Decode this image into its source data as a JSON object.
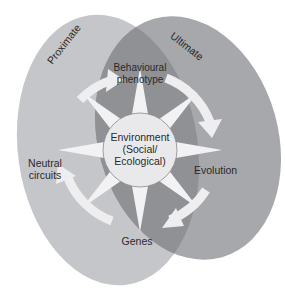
{
  "diagram": {
    "regions": {
      "proximate": {
        "label": "Proximate",
        "color": "#c5c6ca"
      },
      "ultimate": {
        "label": "Ultimate",
        "color": "#a7a8ac"
      },
      "overlap_color": "#909195"
    },
    "center": {
      "line1": "Environment",
      "line2": "(Social/",
      "line3": "Ecological)"
    },
    "cycle": {
      "nodes": [
        {
          "id": "behavioural-phenotype",
          "line1": "Behavioural",
          "line2": "phenotype",
          "position": "top"
        },
        {
          "id": "evolution",
          "line1": "Evolution",
          "position": "right"
        },
        {
          "id": "genes",
          "line1": "Genes",
          "position": "bottom"
        },
        {
          "id": "neutral-circuits",
          "line1": "Neutral",
          "line2": "circuits",
          "position": "left"
        }
      ],
      "direction": "clockwise",
      "arrow_color": "#eeeef0"
    },
    "star_points": 8,
    "star_color": "#f2f2f4"
  }
}
